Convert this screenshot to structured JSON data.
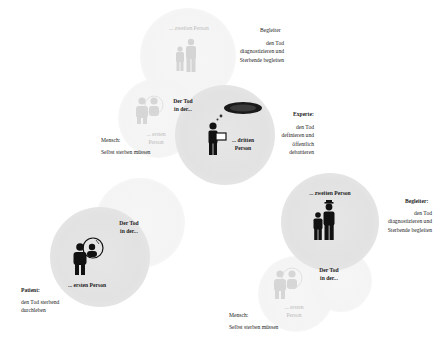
{
  "diagram": {
    "top_group": {
      "faint_circle_label": "... zweiten Person",
      "role_title": "Begleiter",
      "role_lines": [
        "den Tod",
        "diagnostizieren und",
        "Sterbende begleiten"
      ]
    },
    "third_person": {
      "header_lines": [
        "Der Tod",
        "in der..."
      ],
      "circle_label_lines": [
        "... dritten",
        "Person"
      ],
      "role_title": "Experte",
      "role_lines": [
        "den Tod",
        "definieren und",
        "öffentlich",
        "debattieren"
      ],
      "faint_label_lines": [
        "... ersten",
        "Person"
      ],
      "side_title": "Mensch",
      "side_line": "Selbst sterben müssen"
    },
    "first_person": {
      "header_lines": [
        "Der Tod",
        "in der..."
      ],
      "circle_label": "... ersten Person",
      "role_title": "Patient",
      "role_lines": [
        "den Tod sterbend",
        "durchleben"
      ]
    },
    "second_person": {
      "circle_label": "... zweiten Person",
      "role_title": "Begleiter",
      "role_lines": [
        "den Tod",
        "diagnostizieren und",
        "Sterbende begleiten"
      ],
      "header_lines": [
        "Der Tod",
        "in der..."
      ],
      "faint_label_lines": [
        "... ersten",
        "Person"
      ],
      "side_title": "Mensch",
      "side_line": "Selbst sterben müssen"
    },
    "colors": {
      "circle_fill": "#e3e3e3",
      "faint_fill": "#f5f5f5",
      "icon": "#111111",
      "faint_icon": "#cfcfcf"
    }
  }
}
